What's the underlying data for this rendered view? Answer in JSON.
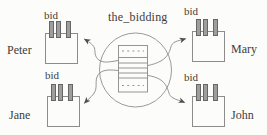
{
  "diagram": {
    "title": "the_bidding",
    "center": {
      "label": "the_bidding",
      "shape": "circle containing a list record with dashed first and last rows"
    },
    "agents": [
      {
        "name": "Peter",
        "box_label": "bid",
        "position": "top-left"
      },
      {
        "name": "Mary",
        "box_label": "bid",
        "position": "top-right"
      },
      {
        "name": "Jane",
        "box_label": "bid",
        "position": "bottom-left"
      },
      {
        "name": "John",
        "box_label": "bid",
        "position": "bottom-right"
      }
    ],
    "colors": {
      "line": "#8a8a8a",
      "arrowhead": "#4f4f4f",
      "text": "#3c3c3c",
      "pin_fill": "#9e9e9e",
      "pin_border": "#666666",
      "background": "#fcfcfa"
    }
  }
}
